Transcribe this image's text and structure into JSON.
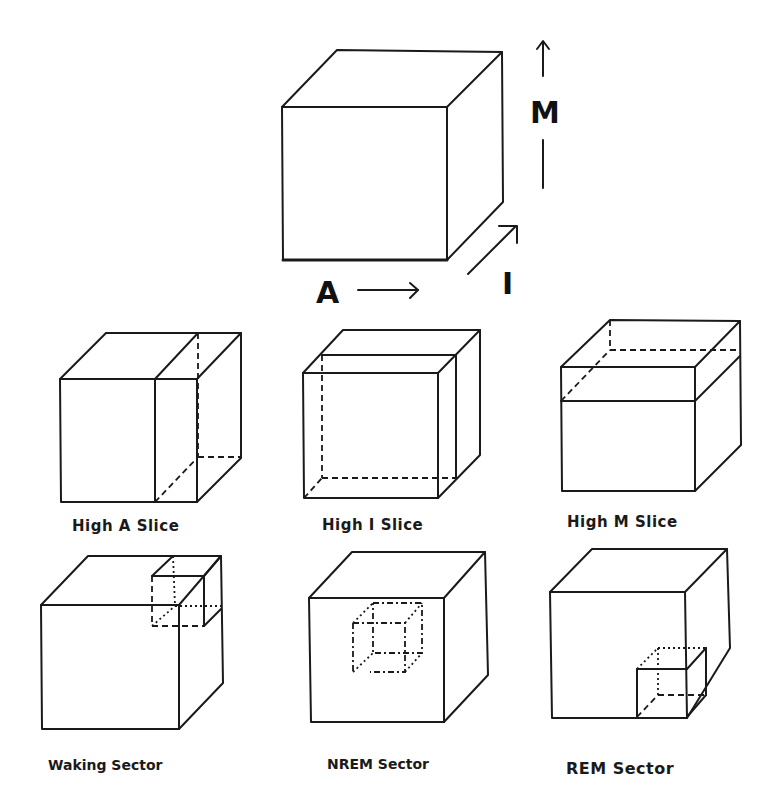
{
  "diagram": {
    "type": "3d-state-space-cube",
    "axes": {
      "a": {
        "label": "A",
        "direction": "right"
      },
      "i": {
        "label": "I",
        "direction": "depth"
      },
      "m": {
        "label": "M",
        "direction": "up"
      }
    },
    "panels": [
      {
        "id": "high-a-slice",
        "label": "High A Slice"
      },
      {
        "id": "high-i-slice",
        "label": "High I Slice"
      },
      {
        "id": "high-m-slice",
        "label": "High M Slice"
      },
      {
        "id": "waking-sector",
        "label": "Waking Sector"
      },
      {
        "id": "nrem-sector",
        "label": "NREM Sector"
      },
      {
        "id": "rem-sector",
        "label": "REM Sector"
      }
    ],
    "colors": {
      "line": "#1a1a1a",
      "background": "#ffffff"
    }
  }
}
